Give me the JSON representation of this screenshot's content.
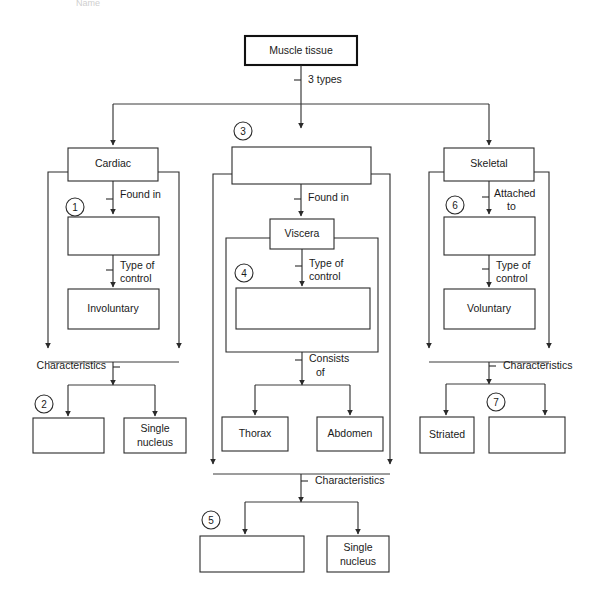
{
  "title_fragment": "Name",
  "diagram": {
    "type": "flowchart",
    "root": {
      "id": "muscle-tissue",
      "label": "Muscle tissue"
    },
    "root_edge_label": "3 types",
    "branches": [
      {
        "id": "cardiac",
        "head_label": "Cardiac",
        "edge1_label": "Found in",
        "blank1_number": "1",
        "blank1_label": "",
        "edge2_label": "Type of control",
        "node3_label": "Involuntary",
        "char_label": "Characteristics",
        "char_blank_number": "2",
        "char_blank_label": "",
        "char_filled_label": "Single nucleus"
      },
      {
        "id": "smooth",
        "head_number": "3",
        "head_label": "",
        "edge1_label": "Found in",
        "node2_label": "Viscera",
        "edge2_label": "Type of control",
        "blank_number": "4",
        "blank_label": "",
        "edge3_label": "Consists of",
        "sub_left_label": "Thorax",
        "sub_right_label": "Abdomen",
        "char_label": "Characteristics",
        "char_blank_number": "5",
        "char_blank_label": "",
        "char_filled_label": "Single nucleus"
      },
      {
        "id": "skeletal",
        "head_label": "Skeletal",
        "edge1_label": "Attached to",
        "blank1_number": "6",
        "blank1_label": "",
        "edge2_label": "Type of control",
        "node3_label": "Voluntary",
        "char_label": "Characteristics",
        "char_filled_label": "Striated",
        "char_blank_number": "7",
        "char_blank_label": ""
      }
    ],
    "colors": {
      "stroke": "#2a2a2a",
      "root_stroke": "#111111",
      "background": "#ffffff",
      "text": "#1a1a1a"
    }
  }
}
